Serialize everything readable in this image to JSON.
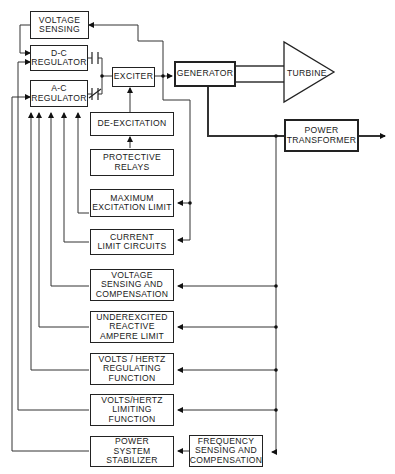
{
  "diagram": {
    "type": "block-diagram",
    "blocks": {
      "voltage_sensing": "VOLTAGE\nSENSING",
      "dc_regulator": "D-C\nREGULATOR",
      "ac_regulator": "A-C\nREGULATOR",
      "exciter": "EXCITER",
      "generator": "GENERATOR",
      "turbine": "TURBINE",
      "power_transformer": "POWER\nTRANSFORMER",
      "de_excitation": "DE-EXCITATION",
      "protective_relays": "PROTECTIVE\nRELAYS",
      "max_excitation_limit": "MAXIMUM\nEXCITATION LIMIT",
      "current_limit_circuits": "CURRENT\nLIMIT CIRCUITS",
      "voltage_sensing_comp": "VOLTAGE\nSENSING AND\nCOMPENSATION",
      "underexcited_limit": "UNDEREXCITED\nREACTIVE\nAMPERE LIMIT",
      "vhz_regulating": "VOLTS / HERTZ\nREGULATING\nFUNCTION",
      "vhz_limiting": "VOLTS/HERTZ\nLIMITING\nFUNCTION",
      "pss": "POWER\nSYSTEM\nSTABILIZER",
      "freq_sensing": "FREQUENCY\nSENSING AND\nCOMPENSATION"
    },
    "connections": [
      {
        "from": "voltage_sensing",
        "to": "dc_regulator"
      },
      {
        "from": "dc_regulator",
        "to": "exciter",
        "via": "normally-open contact"
      },
      {
        "from": "ac_regulator",
        "to": "exciter",
        "via": "normally-closed contact"
      },
      {
        "from": "exciter",
        "to": "generator"
      },
      {
        "from": "exciter",
        "to": "voltage_sensing"
      },
      {
        "from": "exciter",
        "to": "max_excitation_limit"
      },
      {
        "from": "exciter",
        "to": "current_limit_circuits"
      },
      {
        "from": "generator",
        "to": "turbine"
      },
      {
        "from": "generator",
        "to": "power_transformer"
      },
      {
        "from": "protective_relays",
        "to": "de_excitation"
      },
      {
        "from": "de_excitation",
        "to": "exciter"
      },
      {
        "from": "max_excitation_limit",
        "to": "ac_regulator"
      },
      {
        "from": "current_limit_circuits",
        "to": "ac_regulator"
      },
      {
        "from": "voltage_sensing_comp",
        "to": "ac_regulator"
      },
      {
        "from": "underexcited_limit",
        "to": "ac_regulator"
      },
      {
        "from": "vhz_regulating",
        "to": "ac_regulator"
      },
      {
        "from": "vhz_limiting",
        "to": "dc_regulator"
      },
      {
        "from": "pss",
        "to": "ac_regulator"
      },
      {
        "from": "generator",
        "to": "voltage_sensing_comp"
      },
      {
        "from": "generator",
        "to": "underexcited_limit"
      },
      {
        "from": "generator",
        "to": "vhz_regulating"
      },
      {
        "from": "generator",
        "to": "vhz_limiting"
      },
      {
        "from": "generator",
        "to": "freq_sensing"
      },
      {
        "from": "freq_sensing",
        "to": "pss"
      }
    ]
  }
}
